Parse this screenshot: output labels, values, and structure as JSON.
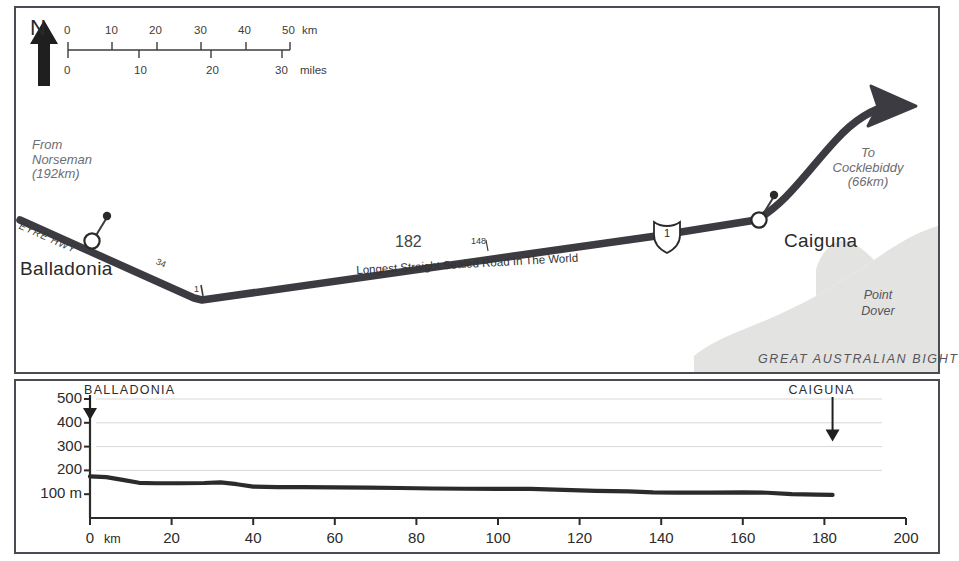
{
  "map": {
    "north_label": "N",
    "scale": {
      "km_ticks": [
        "0",
        "10",
        "20",
        "30",
        "40",
        "50"
      ],
      "km_unit": "km",
      "miles_ticks": [
        "0",
        "10",
        "20",
        "30"
      ],
      "miles_unit": "miles"
    },
    "origin_note": {
      "line1": "From",
      "line2": "Norseman",
      "line3": "(192km)"
    },
    "destination_note": {
      "line1": "To",
      "line2": "Cocklebiddy",
      "line3": "(66km)"
    },
    "highway_name": "EYRE  HWY",
    "highway_shield_number": "1",
    "towns": [
      {
        "name": "Balladonia"
      },
      {
        "name": "Caiguna"
      }
    ],
    "distance_markers": [
      "34",
      "1",
      "182",
      "148"
    ],
    "straight_road_caption": "Longest Straight Sealed Road In The World",
    "sea_label": "GREAT   AUSTRALIAN   BIGHT",
    "headland": {
      "line1": "Point",
      "line2": "Dover"
    },
    "colors": {
      "road": "#3b3b41",
      "border": "#4a4a52",
      "sea_fill": "#e3e3e1",
      "text": "#2b2b2b",
      "muted_text": "#6d6d72"
    }
  },
  "chart_data": {
    "type": "area",
    "title": "",
    "xlabel": "km",
    "ylabel": "m",
    "xlim": [
      0,
      200
    ],
    "ylim": [
      0,
      500
    ],
    "grid": true,
    "legend": "none",
    "x_ticks": [
      0,
      20,
      40,
      60,
      80,
      100,
      120,
      140,
      160,
      180,
      200
    ],
    "x_tick_labels": [
      "0",
      "20",
      "40",
      "60",
      "80",
      "100",
      "120",
      "140",
      "160",
      "180",
      "200"
    ],
    "y_ticks": [
      100,
      200,
      300,
      400,
      500
    ],
    "y_tick_labels": [
      "100 m",
      "200",
      "300",
      "400",
      "500"
    ],
    "series": [
      {
        "name": "Eyre Highway elevation profile",
        "x": [
          0,
          4,
          8,
          12,
          16,
          22,
          28,
          32,
          36,
          40,
          46,
          52,
          60,
          68,
          76,
          84,
          92,
          100,
          108,
          116,
          124,
          132,
          138,
          144,
          152,
          160,
          166,
          172,
          178,
          182
        ],
        "y": [
          175,
          172,
          160,
          148,
          146,
          146,
          147,
          150,
          142,
          132,
          130,
          130,
          129,
          128,
          126,
          124,
          123,
          122,
          122,
          118,
          114,
          112,
          108,
          107,
          107,
          108,
          106,
          100,
          98,
          97
        ]
      }
    ],
    "annotations": [
      {
        "label": "BALLADONIA",
        "x": 0,
        "marker": "down-arrow"
      },
      {
        "label": "CAIGUNA",
        "x": 182,
        "marker": "down-arrow"
      }
    ]
  }
}
